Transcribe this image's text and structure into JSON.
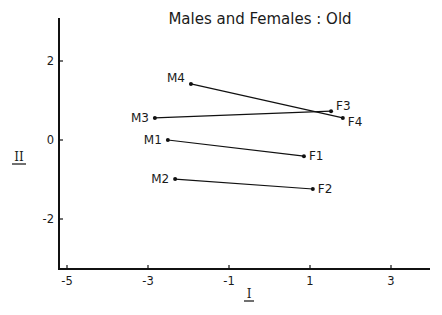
{
  "chart_data": {
    "type": "scatter",
    "title": "Males and Females : Old",
    "xlabel": "I",
    "ylabel": "II",
    "xlim": [
      -5.22,
      3.96
    ],
    "ylim": [
      -3.27,
      3.1
    ],
    "xticks": [
      -5,
      -3,
      -1,
      1,
      3
    ],
    "yticks": [
      2,
      0,
      -2
    ],
    "grid": false,
    "legend": "none",
    "points": [
      {
        "label": "M1",
        "x": -2.51,
        "y": 0.0
      },
      {
        "label": "M2",
        "x": -2.33,
        "y": -0.99
      },
      {
        "label": "M3",
        "x": -2.83,
        "y": 0.56
      },
      {
        "label": "M4",
        "x": -1.94,
        "y": 1.42
      },
      {
        "label": "F1",
        "x": 0.85,
        "y": -0.41
      },
      {
        "label": "F2",
        "x": 1.07,
        "y": -1.24
      },
      {
        "label": "F3",
        "x": 1.52,
        "y": 0.73
      },
      {
        "label": "F4",
        "x": 1.81,
        "y": 0.56
      }
    ],
    "segments": [
      {
        "from": "M1",
        "to": "F1"
      },
      {
        "from": "M2",
        "to": "F2"
      },
      {
        "from": "M3",
        "to": "F3"
      },
      {
        "from": "M4",
        "to": "F4"
      }
    ]
  }
}
